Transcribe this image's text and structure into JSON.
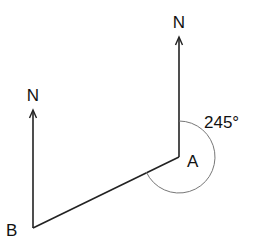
{
  "diagram": {
    "type": "bearing-diagram",
    "points": {
      "A": {
        "label": "A"
      },
      "B": {
        "label": "B"
      }
    },
    "north_labels": {
      "at_A": "N",
      "at_B": "N"
    },
    "bearing": {
      "from": "A",
      "to": "B",
      "value_deg": 245,
      "label": "245°"
    },
    "segments": [
      {
        "from": "A",
        "to": "B"
      }
    ]
  }
}
